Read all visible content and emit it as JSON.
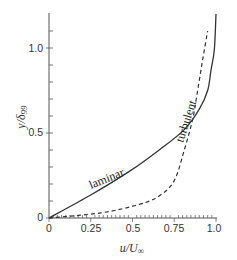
{
  "chart_data": {
    "type": "line",
    "title": "",
    "xlabel": "u/U∞",
    "ylabel": "y/δ99",
    "xlim": [
      0,
      1.0
    ],
    "ylim": [
      0,
      1.2
    ],
    "grid": false,
    "legend": "inline labels",
    "x_ticks": [
      "0",
      "0.25",
      "0.5",
      "0.75",
      "1.0"
    ],
    "y_ticks": [
      "0",
      "0.5",
      "1.0"
    ],
    "series": [
      {
        "name": "laminar",
        "style": "solid",
        "x": [
          0,
          0.25,
          0.49,
          0.66,
          0.81,
          0.9,
          0.95,
          0.97,
          0.99,
          1.0
        ],
        "y": [
          0,
          0.135,
          0.28,
          0.4,
          0.52,
          0.64,
          0.75,
          0.87,
          0.99,
          1.2
        ]
      },
      {
        "name": "turbulent",
        "style": "dashed",
        "x": [
          0,
          0.31,
          0.54,
          0.66,
          0.75,
          0.81,
          0.86,
          0.89,
          0.92,
          0.95
        ],
        "y": [
          0,
          0.03,
          0.08,
          0.13,
          0.22,
          0.4,
          0.58,
          0.75,
          0.93,
          1.1
        ]
      }
    ],
    "annotations": [
      {
        "text": "laminar",
        "near_series": "solid curve"
      },
      {
        "text": "turbulent",
        "near_series": "upper solid/dashed curves"
      }
    ]
  },
  "axes": {
    "x_title_main": "u/U",
    "x_title_sub": "∞",
    "y_title_main": "y/δ",
    "y_title_sub": "99",
    "x_tick_labels": [
      "0",
      "0.25",
      "0.5",
      "0.75",
      "1.0"
    ],
    "y_tick_labels": [
      "0",
      "0.5",
      "1.0"
    ]
  },
  "labels": {
    "laminar": "laminar",
    "turbulent": "turbulent"
  }
}
